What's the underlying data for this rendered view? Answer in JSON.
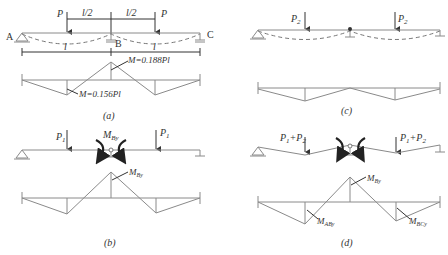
{
  "figure": {
    "panels": [
      {
        "id": "a",
        "caption": "(a)",
        "loads": [
          "P",
          "P"
        ],
        "dimensions": {
          "half_span_left": "l/2",
          "half_span_right": "l/2",
          "span_left": "l",
          "span_right": "l"
        },
        "supports": {
          "left": "A",
          "middle": "B",
          "right": "C"
        },
        "moment_labels": {
          "support": "M=0.188Pl",
          "span": "M=0.156Pl"
        }
      },
      {
        "id": "b",
        "caption": "(b)",
        "loads": [
          "P1",
          "P1"
        ],
        "applied_moment": "MBy",
        "moment_labels": {
          "support": "MBy"
        }
      },
      {
        "id": "c",
        "caption": "(c)",
        "loads": [
          "P2",
          "P2"
        ]
      },
      {
        "id": "d",
        "caption": "(d)",
        "loads": [
          "P1+P2",
          "P1+P2"
        ],
        "moment_labels": {
          "support": "MBy",
          "span_left": "MABy",
          "span_right": "MBCy"
        }
      }
    ]
  },
  "text": {
    "a_P_left": "P",
    "a_P_right": "P",
    "a_half_left": "l/2",
    "a_half_right": "l/2",
    "a_A": "A",
    "a_B": "B",
    "a_C": "C",
    "a_l_left": "l",
    "a_l_right": "l",
    "a_M_support": "M=0.188Pl",
    "a_M_span": "M=0.156Pl",
    "a_caption": "(a)",
    "b_P": "P",
    "b_sub1": "1",
    "b_M": "M",
    "b_sub_By": "By",
    "b_caption": "(b)",
    "c_P": "P",
    "c_sub2": "2",
    "c_caption": "(c)",
    "d_load": "P",
    "d_sub1": "1",
    "d_plus": "+P",
    "d_sub2": "2",
    "d_M": "M",
    "d_sub_By": "By",
    "d_sub_ABy": "ABy",
    "d_sub_BCy": "BCy",
    "d_caption": "(d)"
  }
}
